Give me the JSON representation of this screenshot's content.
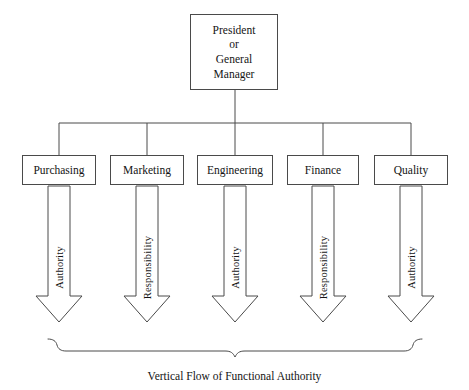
{
  "diagram": {
    "title": "Vertical Flow of Functional Authority",
    "caption": "Vertical  Flow  of Functional Authority",
    "line_color": "#4a4a4a",
    "text_color": "#141414",
    "background": "#ffffff"
  },
  "top_node": {
    "name": "president-or-general-manager",
    "lines": [
      "President",
      "or",
      "General",
      "Manager"
    ],
    "line1": "President",
    "line2": "or",
    "line3": "General",
    "line4": "Manager"
  },
  "departments": [
    {
      "label": "Purchasing",
      "flow_label": "Authority"
    },
    {
      "label": "Marketing",
      "flow_label": "Responsibility"
    },
    {
      "label": "Engineering",
      "flow_label": "Authority"
    },
    {
      "label": "Finance",
      "flow_label": "Responsibility"
    },
    {
      "label": "Quality",
      "flow_label": "Authority"
    }
  ]
}
